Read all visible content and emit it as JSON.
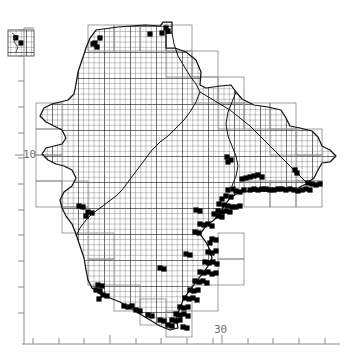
{
  "figure": {
    "title": "",
    "type": "utm-grid-distribution-map",
    "background_color": "#ffffff",
    "ink_color": "#000000",
    "axis_color": "#8a8a8a",
    "grid_line_color": "#2b2b2b",
    "grid_cell_outline_color": "#9a9a9a",
    "record_square_color": "#000000",
    "width_px": 347,
    "height_px": 361
  },
  "axes": {
    "x_axis": {
      "labels": [
        {
          "text": "30",
          "x_px": 222
        }
      ],
      "major_tick_x_px": [
        110,
        222
      ],
      "minor_tick_x_px": [
        33,
        59,
        84,
        110,
        136,
        161,
        187,
        213,
        222,
        248,
        273,
        299,
        325
      ],
      "axis_y_px": 344,
      "axis_x_start_px": 22,
      "axis_x_end_px": 340
    },
    "y_axis": {
      "labels": [
        {
          "text": "10",
          "y_px": 155
        }
      ],
      "major_tick_y_px": [
        155
      ],
      "minor_tick_y_px": [
        30,
        56,
        81,
        107,
        133,
        155,
        158,
        184,
        210,
        235,
        261,
        287,
        313
      ],
      "axis_x_px": 24,
      "axis_y_start_px": 28,
      "axis_y_end_px": 344
    }
  },
  "legend": {
    "present": false,
    "entries": []
  },
  "chart_data": {
    "type": "scatter",
    "title": "",
    "xlabel": "",
    "ylabel": "",
    "grid": true,
    "legend_position": "none",
    "tick_labels": {
      "x": [
        "30"
      ],
      "y": [
        "10"
      ]
    },
    "grid_cell_px": 5.2,
    "grid_block_px": 26,
    "inset_block": {
      "label": "",
      "x_px": 8,
      "y_px": 30,
      "width_px": 26,
      "height_px": 26,
      "filled_cells": [
        [
          1,
          1
        ],
        [
          2,
          2
        ]
      ]
    },
    "record_counts": {
      "total_filled_cells": 132,
      "north_coast": 9,
      "east_coast": 71,
      "south_coast": 38,
      "interior": 14
    },
    "records_px": [
      [
        150,
        34
      ],
      [
        162,
        33
      ],
      [
        100,
        38
      ],
      [
        95,
        43
      ],
      [
        97,
        47
      ],
      [
        93,
        44
      ],
      [
        166,
        28
      ],
      [
        168,
        31
      ],
      [
        227,
        157
      ],
      [
        228,
        162
      ],
      [
        231,
        160
      ],
      [
        295,
        170
      ],
      [
        297,
        173
      ],
      [
        233,
        189
      ],
      [
        228,
        190
      ],
      [
        236,
        191
      ],
      [
        240,
        192
      ],
      [
        244,
        190
      ],
      [
        250,
        190
      ],
      [
        254,
        189
      ],
      [
        258,
        190
      ],
      [
        262,
        189
      ],
      [
        266,
        189
      ],
      [
        270,
        190
      ],
      [
        274,
        190
      ],
      [
        278,
        189
      ],
      [
        282,
        189
      ],
      [
        286,
        190
      ],
      [
        290,
        189
      ],
      [
        294,
        190
      ],
      [
        298,
        191
      ],
      [
        302,
        190
      ],
      [
        306,
        189
      ],
      [
        310,
        190
      ],
      [
        226,
        196
      ],
      [
        231,
        197
      ],
      [
        222,
        199
      ],
      [
        219,
        204
      ],
      [
        224,
        205
      ],
      [
        228,
        206
      ],
      [
        232,
        207
      ],
      [
        236,
        207
      ],
      [
        240,
        206
      ],
      [
        218,
        211
      ],
      [
        222,
        212
      ],
      [
        226,
        211
      ],
      [
        230,
        212
      ],
      [
        214,
        214
      ],
      [
        218,
        216
      ],
      [
        222,
        217
      ],
      [
        200,
        224
      ],
      [
        204,
        225
      ],
      [
        208,
        224
      ],
      [
        212,
        226
      ],
      [
        195,
        232
      ],
      [
        199,
        233
      ],
      [
        212,
        239
      ],
      [
        216,
        240
      ],
      [
        210,
        243
      ],
      [
        208,
        252
      ],
      [
        212,
        253
      ],
      [
        216,
        251
      ],
      [
        205,
        262
      ],
      [
        209,
        263
      ],
      [
        213,
        262
      ],
      [
        217,
        264
      ],
      [
        200,
        272
      ],
      [
        204,
        273
      ],
      [
        208,
        272
      ],
      [
        212,
        274
      ],
      [
        216,
        273
      ],
      [
        195,
        281
      ],
      [
        199,
        282
      ],
      [
        203,
        281
      ],
      [
        207,
        283
      ],
      [
        190,
        290
      ],
      [
        194,
        291
      ],
      [
        198,
        290
      ],
      [
        185,
        298
      ],
      [
        189,
        299
      ],
      [
        193,
        298
      ],
      [
        197,
        300
      ],
      [
        180,
        307
      ],
      [
        184,
        308
      ],
      [
        188,
        307
      ],
      [
        176,
        314
      ],
      [
        180,
        315
      ],
      [
        184,
        314
      ],
      [
        188,
        316
      ],
      [
        172,
        320
      ],
      [
        176,
        321
      ],
      [
        180,
        320
      ],
      [
        183,
        327
      ],
      [
        187,
        328
      ],
      [
        98,
        285
      ],
      [
        102,
        286
      ],
      [
        96,
        290
      ],
      [
        100,
        291
      ],
      [
        103,
        295
      ],
      [
        107,
        296
      ],
      [
        99,
        299
      ],
      [
        124,
        306
      ],
      [
        128,
        307
      ],
      [
        132,
        306
      ],
      [
        136,
        310
      ],
      [
        140,
        311
      ],
      [
        148,
        315
      ],
      [
        152,
        316
      ],
      [
        160,
        320
      ],
      [
        164,
        321
      ],
      [
        168,
        325
      ],
      [
        172,
        326
      ],
      [
        88,
        212
      ],
      [
        92,
        213
      ],
      [
        86,
        216
      ],
      [
        79,
        206
      ],
      [
        83,
        207
      ],
      [
        160,
        268
      ],
      [
        164,
        269
      ],
      [
        186,
        254
      ],
      [
        190,
        255
      ],
      [
        196,
        210
      ],
      [
        200,
        211
      ],
      [
        242,
        179
      ],
      [
        246,
        178
      ],
      [
        250,
        177
      ],
      [
        254,
        176
      ],
      [
        258,
        175
      ],
      [
        262,
        177
      ],
      [
        308,
        183
      ],
      [
        312,
        184
      ],
      [
        316,
        185
      ],
      [
        320,
        184
      ]
    ]
  }
}
